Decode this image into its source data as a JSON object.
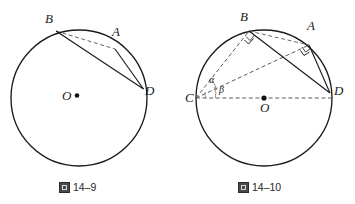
{
  "page": {
    "background_color": "#ffffff",
    "stroke_color": "#1a1a1a",
    "dash_color": "#555555"
  },
  "figures": [
    {
      "id": "fig-14-9",
      "caption_mark": "图",
      "caption_text": "14–9",
      "circle": {
        "cx": 79,
        "cy": 98,
        "r": 68
      },
      "center_label": "O",
      "points": [
        {
          "name": "B",
          "label": "B",
          "x": 52,
          "y": 35
        },
        {
          "name": "A",
          "label": "A",
          "x": 113,
          "y": 46
        },
        {
          "name": "D",
          "label": "D",
          "x": 141,
          "y": 87
        }
      ],
      "segments": [
        {
          "name": "chord-BA",
          "from": "B",
          "to": "A",
          "style": "dashed"
        },
        {
          "name": "chord-BD",
          "from": "B",
          "to": "D",
          "style": "solid"
        },
        {
          "name": "chord-AD",
          "from": "A",
          "to": "D",
          "style": "solid"
        }
      ],
      "angle_marks": []
    },
    {
      "id": "fig-14-10",
      "caption_mark": "图",
      "caption_text": "14–10",
      "circle": {
        "cx": 264,
        "cy": 98,
        "r": 68
      },
      "center_label": "O",
      "points": [
        {
          "name": "B",
          "label": "B",
          "x": 245,
          "y": 32
        },
        {
          "name": "A",
          "label": "A",
          "x": 305,
          "y": 40
        },
        {
          "name": "C",
          "label": "C",
          "x": 196,
          "y": 98
        },
        {
          "name": "D",
          "label": "D",
          "x": 332,
          "y": 98
        }
      ],
      "segments": [
        {
          "name": "diameter-CD",
          "from": "C",
          "to": "D",
          "style": "dashed"
        },
        {
          "name": "chord-CB",
          "from": "C",
          "to": "B",
          "style": "dashed"
        },
        {
          "name": "chord-CA",
          "from": "C",
          "to": "A",
          "style": "dashed"
        },
        {
          "name": "chord-BA",
          "from": "B",
          "to": "A",
          "style": "dashed"
        },
        {
          "name": "chord-BD",
          "from": "B",
          "to": "D",
          "style": "solid"
        },
        {
          "name": "chord-AD",
          "from": "A",
          "to": "D",
          "style": "solid"
        }
      ],
      "angle_marks": [
        {
          "name": "right-angle-at-B",
          "vertex": "B",
          "type": "right"
        },
        {
          "name": "right-angle-at-A",
          "vertex": "A",
          "type": "right"
        },
        {
          "name": "angle-alpha",
          "label": "α",
          "vertex": "C"
        },
        {
          "name": "angle-beta",
          "label": "β",
          "vertex": "C"
        }
      ]
    }
  ],
  "labels": {
    "fig9": {
      "B": "B",
      "A": "A",
      "D": "D",
      "O": "O",
      "caption_mark": "图",
      "caption_text": "14–9"
    },
    "fig10": {
      "B": "B",
      "A": "A",
      "C": "C",
      "D": "D",
      "O": "O",
      "alpha": "α",
      "beta": "β",
      "caption_mark": "图",
      "caption_text": "14–10"
    }
  }
}
